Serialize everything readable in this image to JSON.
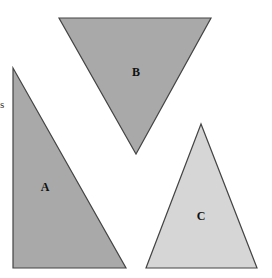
{
  "diagram": {
    "edge_label": "s",
    "colors": {
      "dark_fill": "#a9a9a9",
      "light_fill": "#d6d6d6",
      "stroke": "#444444",
      "text": "#111111"
    },
    "shapes": [
      {
        "id": "A",
        "label": "A",
        "type": "right-triangle",
        "points": "13,68 13,268 126,268",
        "fill": "#a9a9a9",
        "label_x": 45,
        "label_y": 191
      },
      {
        "id": "B",
        "label": "B",
        "type": "inverted-triangle",
        "points": "59,18 211,18 136,154",
        "fill": "#a9a9a9",
        "label_x": 136,
        "label_y": 76
      },
      {
        "id": "C",
        "label": "C",
        "type": "isosceles-triangle",
        "points": "201,124 146,268 257,268",
        "fill": "#d6d6d6",
        "label_x": 201,
        "label_y": 220
      }
    ]
  }
}
